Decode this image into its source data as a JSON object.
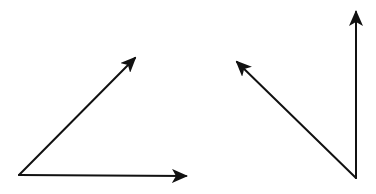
{
  "diagram": {
    "stroke_color": "#111111",
    "background_color": "#ffffff",
    "figures": [
      {
        "name": "left-angle",
        "origin": [
          19,
          175
        ],
        "vectors": [
          {
            "name": "diagonal-up-right",
            "from": [
              19,
              175
            ],
            "to": [
              135,
              58
            ]
          },
          {
            "name": "horizontal-right",
            "from": [
              19,
              175
            ],
            "to": [
              186,
              176
            ]
          }
        ]
      },
      {
        "name": "right-angle",
        "origin": [
          356,
          178
        ],
        "vectors": [
          {
            "name": "diagonal-up-left",
            "from": [
              356,
              178
            ],
            "to": [
              237,
              62
            ]
          },
          {
            "name": "vertical-up",
            "from": [
              356,
              178
            ],
            "to": [
              356,
              12
            ]
          }
        ]
      }
    ]
  }
}
